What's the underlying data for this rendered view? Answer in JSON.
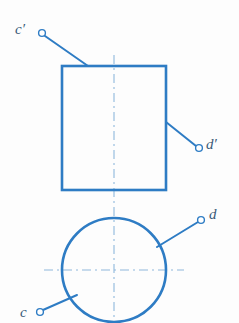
{
  "drawing": {
    "type": "orthographic-projection",
    "title": "Two-view orthographic projection: cylinder with labelled surface points",
    "canvas": {
      "width": 239,
      "height": 323,
      "background": "#fdfdfd"
    }
  },
  "colors": {
    "object_line": "#2e7cc4",
    "object_line_soft": "#4a90cc",
    "center_line": "#8fb8dc",
    "leader_line": "#2e7cc4",
    "marker_fill": "#ffffff",
    "marker_stroke": "#2e7cc4",
    "label_text": "#3a5a78"
  },
  "views": {
    "front_view": {
      "name": "front-view-rectangle",
      "shape": "rectangle",
      "x": 62,
      "y": 66,
      "width": 104,
      "height": 124,
      "stroke_width": 2.6
    },
    "top_view": {
      "name": "top-view-circle",
      "shape": "circle",
      "cx": 114,
      "cy": 270,
      "r": 52,
      "stroke_width": 2.6
    }
  },
  "center_lines": {
    "vertical": {
      "x": 114,
      "y1": 55,
      "y2": 323,
      "stroke_width": 1.1
    },
    "horizontal": {
      "y": 270,
      "x1": 44,
      "x2": 184,
      "stroke_width": 1.1
    },
    "dash_pattern": "9 4 2 4"
  },
  "labels": [
    {
      "id": "c-prime",
      "text": "c′",
      "marker": {
        "cx": 42,
        "cy": 33,
        "r": 3.4
      },
      "leader": {
        "x1": 45,
        "y1": 36,
        "x2": 88,
        "y2": 66
      }
    },
    {
      "id": "d-prime",
      "text": "d′",
      "marker": {
        "cx": 199,
        "cy": 148,
        "r": 3.4
      },
      "leader": {
        "x1": 166,
        "y1": 122,
        "x2": 196,
        "y2": 146
      }
    },
    {
      "id": "d",
      "text": "d",
      "marker": {
        "cx": 201,
        "cy": 220,
        "r": 3.4
      },
      "leader": {
        "x1": 157,
        "y1": 247,
        "x2": 198,
        "y2": 222
      }
    },
    {
      "id": "c",
      "text": "c",
      "marker": {
        "cx": 40,
        "cy": 312,
        "r": 3.4
      },
      "leader": {
        "x1": 43,
        "y1": 310,
        "x2": 77,
        "y2": 295
      }
    }
  ]
}
